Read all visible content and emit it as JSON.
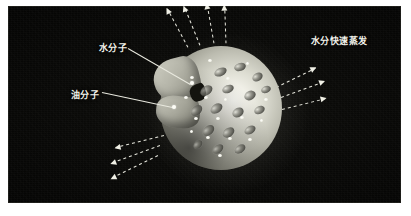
{
  "figure": {
    "title": "",
    "background_color": "#ffffff",
    "panel_color": "#0a0a08",
    "label_color": "#f2f2ea"
  },
  "labels": {
    "water_molecule": "水分子",
    "oil_molecule": "油分子",
    "rapid_evaporation": "水分快速蒸发"
  },
  "diagram": {
    "sphere_highlight_color": "#fbfbf6",
    "oil_blob_color": "#4a4a44",
    "water_dot_color": "#ffffff",
    "arrow_color": "#f0f0e6",
    "leader_color": "#e9e9df"
  },
  "icons": {
    "evaporation_arrow": "dashed-arrow-icon",
    "callout_leader": "leader-line-icon"
  },
  "oil_molecules": [
    {
      "x": 54,
      "y": 22,
      "w": 13,
      "h": 8,
      "r": -24
    },
    {
      "x": 74,
      "y": 17,
      "w": 12,
      "h": 8,
      "r": -18
    },
    {
      "x": 92,
      "y": 27,
      "w": 11,
      "h": 8,
      "r": -30
    },
    {
      "x": 40,
      "y": 40,
      "w": 13,
      "h": 9,
      "r": -34
    },
    {
      "x": 62,
      "y": 39,
      "w": 12,
      "h": 8,
      "r": -22
    },
    {
      "x": 84,
      "y": 45,
      "w": 12,
      "h": 9,
      "r": -28
    },
    {
      "x": 101,
      "y": 40,
      "w": 10,
      "h": 7,
      "r": -20
    },
    {
      "x": 30,
      "y": 60,
      "w": 13,
      "h": 9,
      "r": -40
    },
    {
      "x": 50,
      "y": 58,
      "w": 13,
      "h": 9,
      "r": -34
    },
    {
      "x": 72,
      "y": 62,
      "w": 12,
      "h": 9,
      "r": -30
    },
    {
      "x": 94,
      "y": 60,
      "w": 11,
      "h": 8,
      "r": -26
    },
    {
      "x": 42,
      "y": 80,
      "w": 13,
      "h": 9,
      "r": -40
    },
    {
      "x": 62,
      "y": 82,
      "w": 13,
      "h": 9,
      "r": -36
    },
    {
      "x": 84,
      "y": 80,
      "w": 12,
      "h": 8,
      "r": -30
    },
    {
      "x": 52,
      "y": 99,
      "w": 12,
      "h": 8,
      "r": -38
    },
    {
      "x": 74,
      "y": 99,
      "w": 12,
      "h": 8,
      "r": -34
    },
    {
      "x": 33,
      "y": 95,
      "w": 10,
      "h": 7,
      "r": -44
    }
  ],
  "water_molecules": [
    {
      "x": 30,
      "y": 30,
      "w": 4,
      "h": 3
    },
    {
      "x": 48,
      "y": 13,
      "w": 4,
      "h": 3
    },
    {
      "x": 66,
      "y": 31,
      "w": 4,
      "h": 3
    },
    {
      "x": 86,
      "y": 16,
      "w": 3,
      "h": 3
    },
    {
      "x": 24,
      "y": 50,
      "w": 4,
      "h": 3
    },
    {
      "x": 44,
      "y": 50,
      "w": 4,
      "h": 3
    },
    {
      "x": 64,
      "y": 52,
      "w": 3,
      "h": 3
    },
    {
      "x": 104,
      "y": 52,
      "w": 4,
      "h": 3
    },
    {
      "x": 34,
      "y": 71,
      "w": 4,
      "h": 3
    },
    {
      "x": 56,
      "y": 71,
      "w": 4,
      "h": 3
    },
    {
      "x": 80,
      "y": 70,
      "w": 4,
      "h": 3
    },
    {
      "x": 100,
      "y": 73,
      "w": 3,
      "h": 3
    },
    {
      "x": 46,
      "y": 90,
      "w": 4,
      "h": 3
    },
    {
      "x": 68,
      "y": 91,
      "w": 4,
      "h": 3
    },
    {
      "x": 88,
      "y": 92,
      "w": 4,
      "h": 3
    },
    {
      "x": 58,
      "y": 108,
      "w": 4,
      "h": 3
    },
    {
      "x": 30,
      "y": 84,
      "w": 3,
      "h": 3
    }
  ],
  "arrows": [
    {
      "group": "top",
      "x": 188,
      "y": 46,
      "len": 44,
      "angle": -118
    },
    {
      "group": "top",
      "x": 200,
      "y": 44,
      "len": 42,
      "angle": -112
    },
    {
      "group": "top",
      "x": 214,
      "y": 42,
      "len": 40,
      "angle": -100
    },
    {
      "group": "top",
      "x": 226,
      "y": 42,
      "len": 38,
      "angle": -92
    },
    {
      "group": "right",
      "x": 276,
      "y": 86,
      "len": 44,
      "angle": -26
    },
    {
      "group": "right",
      "x": 281,
      "y": 96,
      "len": 46,
      "angle": -20
    },
    {
      "group": "right",
      "x": 282,
      "y": 108,
      "len": 45,
      "angle": -14
    },
    {
      "group": "bottom",
      "x": 164,
      "y": 134,
      "len": 50,
      "angle": 166
    },
    {
      "group": "bottom",
      "x": 160,
      "y": 144,
      "len": 52,
      "angle": 160
    },
    {
      "group": "bottom",
      "x": 158,
      "y": 154,
      "len": 52,
      "angle": 154
    }
  ],
  "leaders": [
    {
      "name": "water-leader",
      "x": 128,
      "y": 48,
      "len": 72,
      "angle": 30,
      "dot_x": 190,
      "dot_y": 81
    },
    {
      "name": "oil-leader",
      "x": 102,
      "y": 92,
      "len": 72,
      "angle": 12,
      "dot_x": 172,
      "dot_y": 105
    }
  ]
}
